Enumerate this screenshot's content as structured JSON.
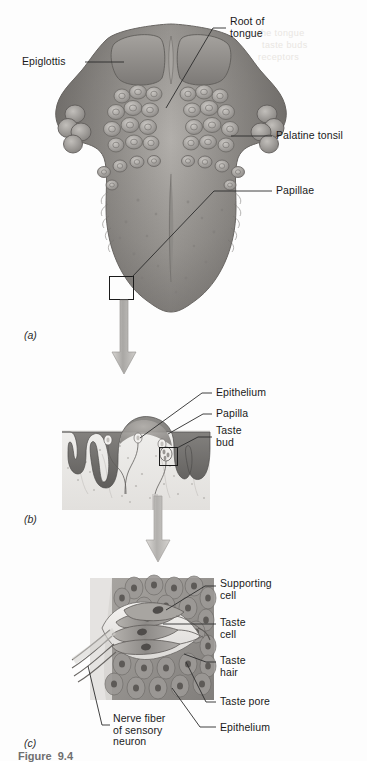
{
  "figure": {
    "domain": "anatomical-diagram",
    "title_partial": "Figure  9.4",
    "background_ghost_text": [
      "the tongue",
      "taste buds",
      "receptors"
    ]
  },
  "panels": [
    {
      "id": "a",
      "id_label": "(a)",
      "name": "tongue-superior-surface",
      "labels": [
        {
          "key": "epiglottis",
          "text": "Epiglottis"
        },
        {
          "key": "root_of_tongue",
          "text": "Root of\ntongue"
        },
        {
          "key": "palatine_tonsil",
          "text": "Palatine tonsil"
        },
        {
          "key": "papillae",
          "text": "Papillae"
        }
      ]
    },
    {
      "id": "b",
      "id_label": "(b)",
      "name": "papilla-cross-section",
      "labels": [
        {
          "key": "epithelium",
          "text": "Epithelium"
        },
        {
          "key": "papilla",
          "text": "Papilla"
        },
        {
          "key": "taste_bud",
          "text": "Taste\nbud"
        }
      ]
    },
    {
      "id": "c",
      "id_label": "(c)",
      "name": "taste-bud-detail",
      "labels": [
        {
          "key": "supporting_cell",
          "text": "Supporting\ncell"
        },
        {
          "key": "taste_cell",
          "text": "Taste\ncell"
        },
        {
          "key": "taste_hair",
          "text": "Taste\nhair"
        },
        {
          "key": "taste_pore",
          "text": "Taste pore"
        },
        {
          "key": "epithelium_c",
          "text": "Epithelium"
        },
        {
          "key": "nerve_fiber",
          "text": "Nerve fiber\nof sensory\nneuron"
        }
      ]
    }
  ],
  "colors": {
    "tissue_mid": "#8e8c8a",
    "tissue_dark": "#5d5b59",
    "tissue_light": "#c9c6c2",
    "epithelium_band": "#6f6d6b",
    "arrow": "#b9b7b4",
    "line": "#2b2b2b",
    "text": "#1a1a1a",
    "page": "#fdfdfd"
  }
}
